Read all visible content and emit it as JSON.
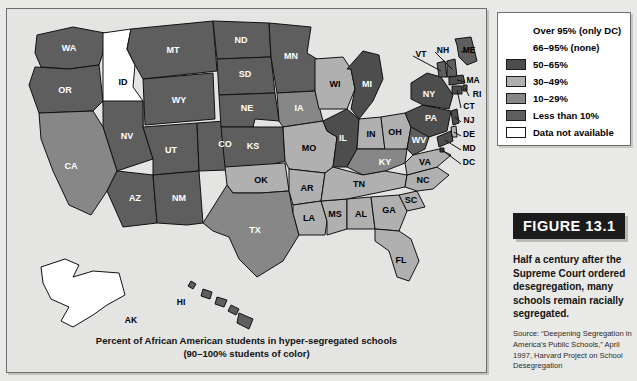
{
  "map": {
    "caption_line1": "Percent of African American students in hyper-segregated schools",
    "caption_line2": "(90–100% students of color)"
  },
  "legend": {
    "items": [
      {
        "label": "Over 95% (only DC)",
        "color": "none",
        "swatch": false
      },
      {
        "label": "66–95% (none)",
        "color": "none",
        "swatch": false
      },
      {
        "label": "50–65%",
        "color": "#4d4d4d",
        "swatch": true
      },
      {
        "label": "30–49%",
        "color": "#b0b0b0",
        "swatch": true
      },
      {
        "label": "10–29%",
        "color": "#878787",
        "swatch": true
      },
      {
        "label": "Less than 10%",
        "color": "#5e5e5e",
        "swatch": true
      },
      {
        "label": "Data not available",
        "color": "#ffffff",
        "swatch": true
      }
    ]
  },
  "figure": {
    "tag": "FIGURE 13.1",
    "caption": "Half a century after the Supreme Court ordered desegregation, many schools remain racially segregated.",
    "source": "Source: “Deepening Segregation in America’s Public Schools,” April 1997, Harvard Project on School Desegregation"
  },
  "chart_data": {
    "type": "map",
    "title": "Percent of African American students in hyper-segregated schools (90–100% students of color)",
    "legend_position": "top-right",
    "categories": [
      "Over 95% (only DC)",
      "66–95% (none)",
      "50–65%",
      "30–49%",
      "10–29%",
      "Less than 10%",
      "Data not available"
    ],
    "category_colors": [
      "#3a3a3a",
      "#3a3a3a",
      "#4d4d4d",
      "#b0b0b0",
      "#878787",
      "#5e5e5e",
      "#ffffff"
    ],
    "states": [
      {
        "code": "WA",
        "category": "Less than 10%",
        "color": "#5e5e5e"
      },
      {
        "code": "OR",
        "category": "Less than 10%",
        "color": "#5e5e5e"
      },
      {
        "code": "ID",
        "category": "Data not available",
        "color": "#ffffff"
      },
      {
        "code": "MT",
        "category": "Less than 10%",
        "color": "#5e5e5e"
      },
      {
        "code": "WY",
        "category": "Less than 10%",
        "color": "#5e5e5e"
      },
      {
        "code": "NV",
        "category": "Less than 10%",
        "color": "#5e5e5e"
      },
      {
        "code": "UT",
        "category": "Less than 10%",
        "color": "#5e5e5e"
      },
      {
        "code": "CA",
        "category": "10–29%",
        "color": "#878787"
      },
      {
        "code": "AZ",
        "category": "Less than 10%",
        "color": "#5e5e5e"
      },
      {
        "code": "CO",
        "category": "Less than 10%",
        "color": "#5e5e5e"
      },
      {
        "code": "NM",
        "category": "Less than 10%",
        "color": "#5e5e5e"
      },
      {
        "code": "ND",
        "category": "Less than 10%",
        "color": "#5e5e5e"
      },
      {
        "code": "SD",
        "category": "Less than 10%",
        "color": "#5e5e5e"
      },
      {
        "code": "NE",
        "category": "Less than 10%",
        "color": "#5e5e5e"
      },
      {
        "code": "KS",
        "category": "Less than 10%",
        "color": "#5e5e5e"
      },
      {
        "code": "OK",
        "category": "30–49%",
        "color": "#b0b0b0"
      },
      {
        "code": "TX",
        "category": "10–29%",
        "color": "#878787"
      },
      {
        "code": "MN",
        "category": "Less than 10%",
        "color": "#5e5e5e"
      },
      {
        "code": "IA",
        "category": "10–29%",
        "color": "#878787"
      },
      {
        "code": "MO",
        "category": "30–49%",
        "color": "#b0b0b0"
      },
      {
        "code": "AR",
        "category": "30–49%",
        "color": "#b0b0b0"
      },
      {
        "code": "LA",
        "category": "30–49%",
        "color": "#b0b0b0"
      },
      {
        "code": "WI",
        "category": "30–49%",
        "color": "#b0b0b0"
      },
      {
        "code": "IL",
        "category": "50–65%",
        "color": "#4d4d4d"
      },
      {
        "code": "MS",
        "category": "30–49%",
        "color": "#b0b0b0"
      },
      {
        "code": "MI",
        "category": "50–65%",
        "color": "#4d4d4d"
      },
      {
        "code": "IN",
        "category": "30–49%",
        "color": "#b0b0b0"
      },
      {
        "code": "OH",
        "category": "30–49%",
        "color": "#b0b0b0"
      },
      {
        "code": "KY",
        "category": "10–29%",
        "color": "#878787"
      },
      {
        "code": "TN",
        "category": "30–49%",
        "color": "#b0b0b0"
      },
      {
        "code": "AL",
        "category": "30–49%",
        "color": "#b0b0b0"
      },
      {
        "code": "GA",
        "category": "30–49%",
        "color": "#b0b0b0"
      },
      {
        "code": "FL",
        "category": "30–49%",
        "color": "#b0b0b0"
      },
      {
        "code": "SC",
        "category": "30–49%",
        "color": "#b0b0b0"
      },
      {
        "code": "NC",
        "category": "30–49%",
        "color": "#b0b0b0"
      },
      {
        "code": "VA",
        "category": "30–49%",
        "color": "#b0b0b0"
      },
      {
        "code": "WV",
        "category": "Less than 10%",
        "color": "#5e5e5e"
      },
      {
        "code": "PA",
        "category": "50–65%",
        "color": "#4d4d4d"
      },
      {
        "code": "NY",
        "category": "50–65%",
        "color": "#4d4d4d"
      },
      {
        "code": "VT",
        "category": "Less than 10%",
        "color": "#5e5e5e"
      },
      {
        "code": "NH",
        "category": "Less than 10%",
        "color": "#5e5e5e"
      },
      {
        "code": "ME",
        "category": "Less than 10%",
        "color": "#5e5e5e"
      },
      {
        "code": "MA",
        "category": "50–65%",
        "color": "#4d4d4d"
      },
      {
        "code": "RI",
        "category": "50–65%",
        "color": "#4d4d4d"
      },
      {
        "code": "CT",
        "category": "50–65%",
        "color": "#4d4d4d"
      },
      {
        "code": "NJ",
        "category": "50–65%",
        "color": "#4d4d4d"
      },
      {
        "code": "DE",
        "category": "30–49%",
        "color": "#b0b0b0"
      },
      {
        "code": "MD",
        "category": "50–65%",
        "color": "#4d4d4d"
      },
      {
        "code": "DC",
        "category": "Over 95% (only DC)",
        "color": "#3a3a3a"
      },
      {
        "code": "AK",
        "category": "Data not available",
        "color": "#ffffff"
      },
      {
        "code": "HI",
        "category": "Less than 10%",
        "color": "#5e5e5e"
      }
    ]
  }
}
